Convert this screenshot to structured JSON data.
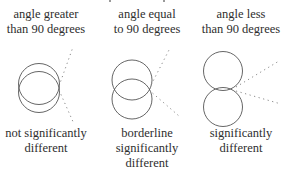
{
  "panels": [
    {
      "top_lines": [
        "angle greater",
        "than 90 degrees"
      ],
      "bottom_lines": [
        "not significantly",
        "different"
      ],
      "angle": "greater than 90 degrees",
      "significance": "not significantly different"
    },
    {
      "top_lines": [
        "angle equal",
        "to 90 degrees"
      ],
      "bottom_lines": [
        "borderline",
        "significantly",
        "different"
      ],
      "angle": "equal to 90 degrees",
      "significance": "borderline significantly different"
    },
    {
      "top_lines": [
        "angle less",
        "than 90 degrees"
      ],
      "bottom_lines": [
        "significantly",
        "different"
      ],
      "angle": "less than 90 degrees",
      "significance": "significantly different"
    }
  ],
  "colors": {
    "circle_stroke": "#555555",
    "dotted_line": "#8a8a8a",
    "text": "#2e2e2e"
  }
}
